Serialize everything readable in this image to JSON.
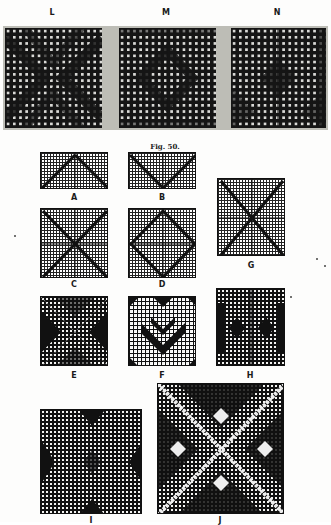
{
  "document": {
    "figure_caption": "Fig. 50.",
    "top_row_labels": [
      "L",
      "M",
      "N"
    ],
    "diagrams": [
      {
        "id": "A",
        "label": "A",
        "type": "point-draft grid"
      },
      {
        "id": "B",
        "label": "B",
        "type": "point-draft grid"
      },
      {
        "id": "G",
        "label": "G",
        "type": "point-draft grid"
      },
      {
        "id": "C",
        "label": "C",
        "type": "point-draft grid"
      },
      {
        "id": "D",
        "label": "D",
        "type": "point-draft grid"
      },
      {
        "id": "E",
        "label": "E",
        "type": "weave pattern"
      },
      {
        "id": "F",
        "label": "F",
        "type": "weave pattern"
      },
      {
        "id": "H",
        "label": "H",
        "type": "weave pattern"
      },
      {
        "id": "I",
        "label": "I",
        "type": "weave pattern"
      },
      {
        "id": "J",
        "label": "J",
        "type": "weave pattern"
      }
    ]
  },
  "colors": {
    "ink": "#151515",
    "paper": "#fdfdfc",
    "strip_gray": "#bdbdb6",
    "cell_light": "#d9d9d6"
  }
}
